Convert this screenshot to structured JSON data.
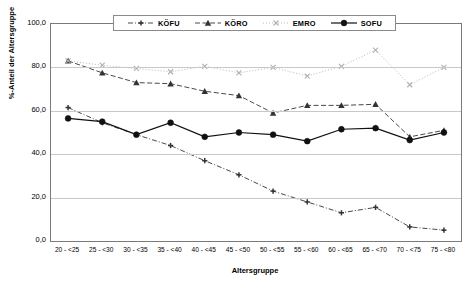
{
  "chart_data": {
    "type": "line",
    "title": "",
    "xlabel": "Altersgruppe",
    "ylabel": "%-Anteil der Altersgruppe",
    "ylim": [
      0,
      100
    ],
    "ytick_labels": [
      "100,0",
      "80,0",
      "60,0",
      "40,0",
      "20,0",
      "0,0"
    ],
    "ytick_values": [
      100,
      80,
      60,
      40,
      20,
      0
    ],
    "grid": true,
    "legend_position": "top-center",
    "categories": [
      "20 - <25",
      "25 - <30",
      "30 - <35",
      "35 - <40",
      "40 - <45",
      "45 - <50",
      "50 - <55",
      "55 - <60",
      "60 - <65",
      "65 - <70",
      "70 - <75",
      "75 - <80"
    ],
    "series": [
      {
        "name": "KÖFU",
        "color": "#333333",
        "marker": "plus",
        "dash": "dashdot",
        "values": [
          61.5,
          54.5,
          49.0,
          44.0,
          37.0,
          30.5,
          23.0,
          18.0,
          13.0,
          15.5,
          6.5,
          5.0
        ]
      },
      {
        "name": "KÖRO",
        "color": "#333333",
        "marker": "triangle",
        "dash": "dashed",
        "values": [
          83.0,
          77.5,
          73.0,
          72.5,
          69.0,
          67.0,
          59.0,
          62.5,
          62.5,
          63.0,
          48.0,
          51.0
        ]
      },
      {
        "name": "EMRO",
        "color": "#b0b0b0",
        "marker": "cross",
        "dash": "dotted",
        "values": [
          83.0,
          81.0,
          79.5,
          78.0,
          80.5,
          77.5,
          80.0,
          76.0,
          80.5,
          88.0,
          72.0,
          80.0
        ]
      },
      {
        "name": "SOFU",
        "color": "#111111",
        "marker": "circle",
        "dash": "solid",
        "values": [
          56.5,
          55.0,
          49.0,
          54.5,
          48.0,
          50.0,
          49.0,
          46.0,
          51.5,
          52.0,
          46.5,
          50.0
        ]
      }
    ]
  },
  "legend": {
    "entries": [
      {
        "label": "KÖFU"
      },
      {
        "label": "KÖRO"
      },
      {
        "label": "EMRO"
      },
      {
        "label": "SOFU"
      }
    ]
  }
}
